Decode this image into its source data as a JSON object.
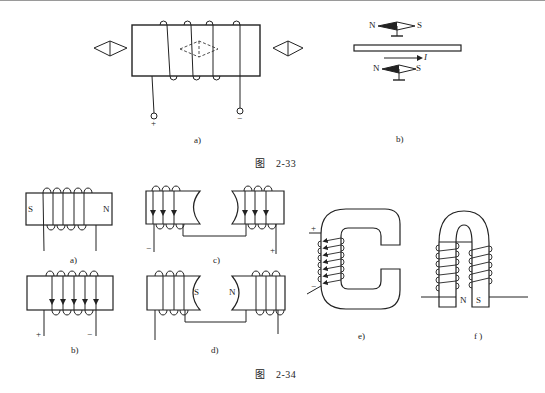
{
  "figure_2_33": {
    "caption": "图　2-33",
    "panel_a": {
      "label": "a)",
      "plus": "+",
      "minus": "−"
    },
    "panel_b": {
      "label": "b)",
      "top_compass": {
        "north": "N",
        "south": "S"
      },
      "bottom_compass": {
        "north": "N",
        "south": "S"
      },
      "current_label": "I"
    }
  },
  "figure_2_34": {
    "caption": "图　2-34",
    "panel_a": {
      "label": "a)",
      "left_pole": "S",
      "right_pole": "N"
    },
    "panel_b": {
      "label": "b)",
      "plus": "+",
      "minus": "−"
    },
    "panel_c": {
      "label": "c)",
      "minus": "−",
      "plus": "+"
    },
    "panel_d": {
      "label": "d)",
      "left_pole": "S",
      "right_pole": "N"
    },
    "panel_e": {
      "label": "e)",
      "plus": "+",
      "minus": "−"
    },
    "panel_f": {
      "label": "f )",
      "left_pole": "N",
      "right_pole": "S"
    }
  }
}
